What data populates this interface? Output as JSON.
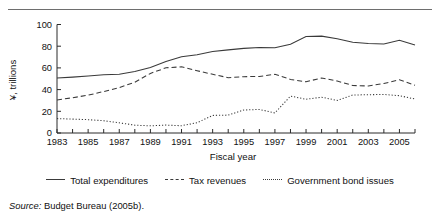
{
  "figure": {
    "source_prefix": "Source:",
    "source_text": " Budget Bureau (2005b)."
  },
  "axes": {
    "x_title": "Fiscal year",
    "y_title": "¥, trillions",
    "y_ticks": [
      "0",
      "20",
      "40",
      "60",
      "80",
      "100"
    ],
    "x_ticks_labeled": [
      "1983",
      "1985",
      "1987",
      "1989",
      "1991",
      "1993",
      "1995",
      "1997",
      "1999",
      "2001",
      "2003",
      "2005"
    ]
  },
  "legend": {
    "items": [
      {
        "label": "Total expenditures",
        "style": "solid"
      },
      {
        "label": "Tax revenues",
        "style": "dashed"
      },
      {
        "label": "Government bond issues",
        "style": "dotted"
      }
    ]
  },
  "chart_data": {
    "type": "line",
    "title": "",
    "xlabel": "Fiscal year",
    "ylabel": "¥, trillions",
    "xlim": [
      1983,
      2006
    ],
    "ylim": [
      0,
      100
    ],
    "grid": false,
    "legend_position": "bottom",
    "x": [
      1983,
      1984,
      1985,
      1986,
      1987,
      1988,
      1989,
      1990,
      1991,
      1992,
      1993,
      1994,
      1995,
      1996,
      1997,
      1998,
      1999,
      2000,
      2001,
      2002,
      2003,
      2004,
      2005,
      2006
    ],
    "series": [
      {
        "name": "Total expenditures",
        "style": "solid",
        "color": "#3a3a3a",
        "values": [
          50.6,
          51.5,
          52.5,
          53.6,
          54.1,
          56.7,
          60.4,
          65.9,
          70.3,
          72.2,
          75.1,
          76.6,
          78.0,
          78.8,
          78.5,
          81.9,
          89.0,
          89.3,
          86.9,
          83.7,
          82.4,
          82.1,
          85.5,
          81.0
        ]
      },
      {
        "name": "Tax revenues",
        "style": "dashed",
        "color": "#3a3a3a",
        "values": [
          30.5,
          32.5,
          34.9,
          38.2,
          41.9,
          46.8,
          54.9,
          60.1,
          61.0,
          57.4,
          54.1,
          51.0,
          51.9,
          52.1,
          54.1,
          49.4,
          47.2,
          50.7,
          47.9,
          43.8,
          43.3,
          45.6,
          49.1,
          44.0
        ]
      },
      {
        "name": "Government bond issues",
        "style": "dotted",
        "color": "#3a3a3a",
        "values": [
          13.3,
          12.8,
          12.3,
          11.3,
          9.4,
          7.2,
          6.6,
          7.3,
          6.7,
          9.5,
          16.2,
          16.5,
          21.2,
          21.7,
          18.5,
          34.0,
          31.1,
          33.0,
          30.0,
          35.0,
          35.3,
          35.5,
          34.4,
          31.3
        ]
      }
    ]
  }
}
